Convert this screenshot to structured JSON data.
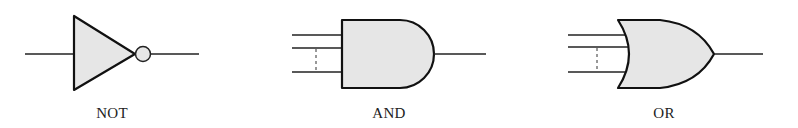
{
  "diagram": {
    "type": "logic-gate-symbols",
    "fill_color": "#e6e6e6",
    "stroke_color": "#111111",
    "gates": [
      {
        "id": "not",
        "label": "NOT",
        "inputs": 1,
        "has_inversion_bubble": true
      },
      {
        "id": "and",
        "label": "AND",
        "inputs": "2..n (dashed indicates more)",
        "has_inversion_bubble": false
      },
      {
        "id": "or",
        "label": "OR",
        "inputs": "2..n (dashed indicates more)",
        "has_inversion_bubble": false
      }
    ]
  }
}
